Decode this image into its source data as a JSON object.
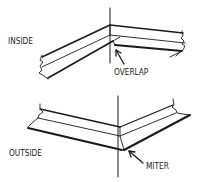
{
  "diagram": {
    "type": "technical-illustration",
    "panels": [
      {
        "id": "inside",
        "side_label": "INSIDE",
        "callout_label": "OVERLAP"
      },
      {
        "id": "outside",
        "side_label": "OUTSIDE",
        "callout_label": "MITER"
      }
    ],
    "colors": {
      "ink": "#1a1a1a",
      "background": "#ffffff"
    }
  }
}
